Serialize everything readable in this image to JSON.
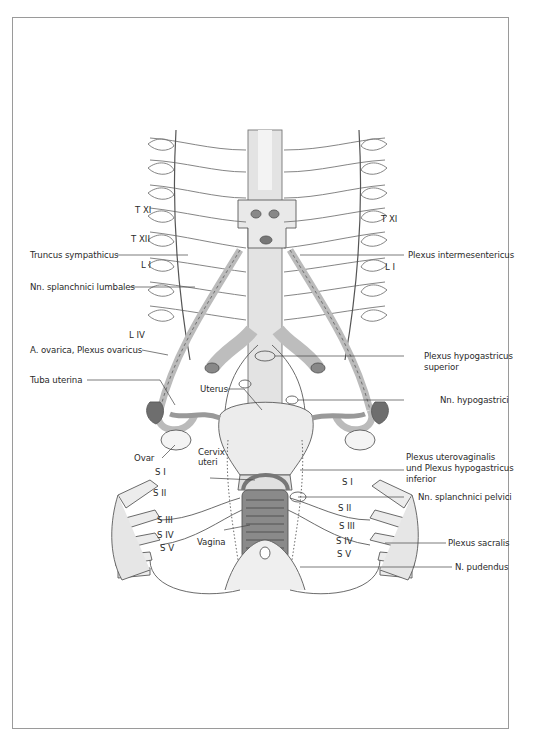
{
  "figure": {
    "labels_left": [
      {
        "id": "truncus-sympathicus",
        "text": "Truncus sympathicus"
      },
      {
        "id": "nn-splanchnici-lumbales",
        "text": "Nn. splanchnici lumbales"
      },
      {
        "id": "a-ovarica",
        "text": "A. ovarica, Plexus ovaricus"
      },
      {
        "id": "tuba-uterina",
        "text": "Tuba uterina"
      },
      {
        "id": "ovar",
        "text": "Ovar"
      },
      {
        "id": "uterus",
        "text": "Uterus"
      },
      {
        "id": "cervix-uteri-1",
        "text": "Cervix"
      },
      {
        "id": "cervix-uteri-2",
        "text": "uteri"
      },
      {
        "id": "vagina",
        "text": "Vagina"
      }
    ],
    "labels_right": [
      {
        "id": "plexus-intermesentericus",
        "text": "Plexus intermesentericus"
      },
      {
        "id": "plexus-hypogastricus-superior-1",
        "text": "Plexus hypogastricus"
      },
      {
        "id": "plexus-hypogastricus-superior-2",
        "text": "superior"
      },
      {
        "id": "nn-hypogastrici",
        "text": "Nn. hypogastrici"
      },
      {
        "id": "plexus-uterovaginalis-1",
        "text": "Plexus uterovaginalis"
      },
      {
        "id": "plexus-uterovaginalis-2",
        "text": "und Plexus hypogastricus"
      },
      {
        "id": "plexus-uterovaginalis-3",
        "text": "inferior"
      },
      {
        "id": "nn-splanchnici-pelvici",
        "text": "Nn. splanchnici pelvici"
      },
      {
        "id": "plexus-sacralis",
        "text": "Plexus sacralis"
      },
      {
        "id": "n-pudendus",
        "text": "N. pudendus"
      }
    ],
    "spinal_levels_left": [
      "T XI",
      "T XII",
      "L I",
      "L IV",
      "S I",
      "S II",
      "S III",
      "S IV",
      "S V"
    ],
    "spinal_levels_right": [
      "T XI",
      "L I",
      "S I",
      "S II",
      "S III",
      "S IV",
      "S V"
    ],
    "colors": {
      "line": "#555555",
      "frame": "#9a9a9a",
      "fill_gray": "#d8d8d8",
      "fill_light": "#ececec",
      "ovary_dark": "#6e6e6e"
    }
  }
}
